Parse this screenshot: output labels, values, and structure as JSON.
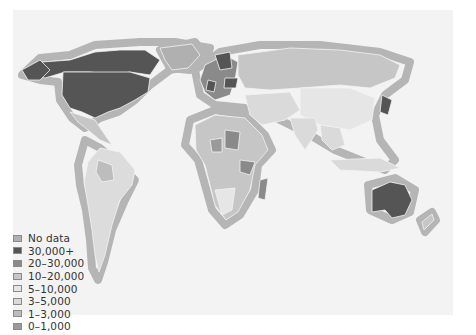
{
  "map": {
    "type": "choropleth",
    "subject": "World map shaded by value bands",
    "background_color": "#f3f3f3",
    "coast_halo_color": "#b5b5b5"
  },
  "legend": {
    "items": [
      {
        "label": "No data",
        "color": "#b0b0b0"
      },
      {
        "label": "30,000+",
        "color": "#555555"
      },
      {
        "label": "20–30,000",
        "color": "#8a8a8a"
      },
      {
        "label": "10–20,000",
        "color": "#c6c6c6"
      },
      {
        "label": "5–10,000",
        "color": "#e6e6e6"
      },
      {
        "label": "3–5,000",
        "color": "#dadada"
      },
      {
        "label": "1–3,000",
        "color": "#bdbdbd"
      },
      {
        "label": "0–1,000",
        "color": "#9a9a9a"
      }
    ]
  }
}
